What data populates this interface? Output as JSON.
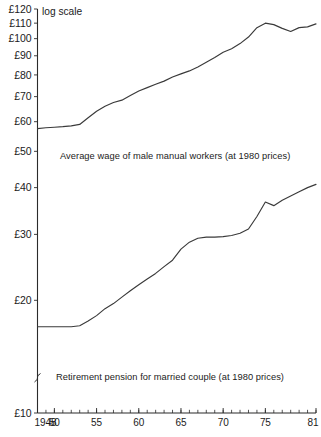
{
  "figure": {
    "top_title_fragment": "",
    "scale_note": "log scale"
  },
  "axes": {
    "y_tick_labels": [
      "£120",
      "£110",
      "£100",
      "£90",
      "£80",
      "£70",
      "£60",
      "£50",
      "£40",
      "£30",
      "£20",
      "£10"
    ],
    "y_tick_values": [
      120,
      110,
      100,
      90,
      80,
      70,
      60,
      50,
      40,
      30,
      20,
      10
    ],
    "y_axis_break": true,
    "x_tick_labels": [
      "1948",
      "50",
      "55",
      "60",
      "65",
      "70",
      "75",
      "81"
    ],
    "x_tick_values": [
      1948,
      1950,
      1955,
      1960,
      1965,
      1970,
      1975,
      1981
    ],
    "x_minor_step": 1
  },
  "annotations": {
    "wage_caption": "Average wage of male manual workers (at 1980 prices)",
    "pension_caption": "Retirement pension for married couple (at 1980 prices)"
  },
  "colors": {
    "line": "#3a3a3a",
    "axis": "#2b2b2b",
    "background": "#ffffff"
  },
  "chart_data": {
    "type": "line",
    "title": "",
    "xlabel": "",
    "ylabel": "£ (1980 prices)",
    "scale": "log",
    "ylim": [
      10,
      120
    ],
    "xlim": [
      1948,
      1981
    ],
    "grid": false,
    "legend": "inline-annotations",
    "x": [
      1948,
      1949,
      1950,
      1951,
      1952,
      1953,
      1954,
      1955,
      1956,
      1957,
      1958,
      1959,
      1960,
      1961,
      1962,
      1963,
      1964,
      1965,
      1966,
      1967,
      1968,
      1969,
      1970,
      1971,
      1972,
      1973,
      1974,
      1975,
      1976,
      1977,
      1978,
      1979,
      1980,
      1981
    ],
    "series": [
      {
        "name": "Average wage of male manual workers (at 1980 prices)",
        "values": [
          57.5,
          57.8,
          58.0,
          58.2,
          58.5,
          59.0,
          61.5,
          64.0,
          66.0,
          67.5,
          68.5,
          70.5,
          72.5,
          74.0,
          75.5,
          77.0,
          79.0,
          80.5,
          82.0,
          84.0,
          86.5,
          89.0,
          92.0,
          94.0,
          97.0,
          101.0,
          107.0,
          110.0,
          109.0,
          106.5,
          104.5,
          107.0,
          107.5,
          109.5
        ]
      },
      {
        "name": "Retirement pension for married couple (at 1980 prices)",
        "values": [
          17.0,
          17.0,
          17.0,
          17.0,
          17.0,
          17.1,
          17.6,
          18.2,
          19.0,
          19.6,
          20.4,
          21.2,
          22.0,
          22.8,
          23.6,
          24.6,
          25.6,
          27.4,
          28.6,
          29.3,
          29.5,
          29.5,
          29.6,
          29.8,
          30.2,
          31.0,
          33.5,
          36.6,
          35.8,
          37.0,
          38.0,
          39.0,
          40.0,
          40.8
        ]
      }
    ]
  }
}
